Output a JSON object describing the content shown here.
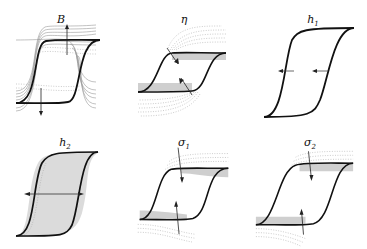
{
  "figure": {
    "colors": {
      "main_curve": "#111111",
      "family_solid": "#8a8a8a",
      "family_dotted": "#9a9a9a",
      "band": "#b5b5b5",
      "arrow": "#222222"
    },
    "panels": [
      {
        "id": "B",
        "label": "B",
        "sub": "",
        "arrows": "vertical-outward",
        "variation": "family of loops with increasing saturation height"
      },
      {
        "id": "eta",
        "label": "η",
        "sub": "",
        "arrows": "diagonal-inward",
        "variation": "dotted loops changing saturation curvature"
      },
      {
        "id": "h1",
        "label": "h",
        "sub": "1",
        "arrows": "horizontal-left",
        "variation": "loop shift left"
      },
      {
        "id": "h2",
        "label": "h",
        "sub": "2",
        "arrows": "horizontal-outward",
        "variation": "loop width increase"
      },
      {
        "id": "sigma1",
        "label": "σ",
        "sub": "1",
        "arrows": "vertical-inward",
        "variation": "upper/lower branch smoothing"
      },
      {
        "id": "sigma2",
        "label": "σ",
        "sub": "2",
        "arrows": "vertical-inward",
        "variation": "branch transition sharpness"
      }
    ]
  }
}
